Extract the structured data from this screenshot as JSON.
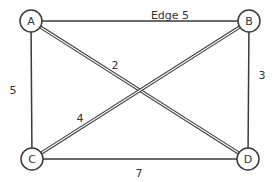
{
  "diagram": {
    "type": "weighted-undirected-graph",
    "colors": {
      "stroke": "#3a3a3a",
      "node_fill": "#ffffff",
      "text": "#333333",
      "background": "#ffffff"
    },
    "nodes": [
      {
        "id": "A",
        "label": "A",
        "x": 31,
        "y": 21,
        "r": 11
      },
      {
        "id": "B",
        "label": "B",
        "x": 249,
        "y": 21,
        "r": 11
      },
      {
        "id": "C",
        "label": "C",
        "x": 32,
        "y": 159,
        "r": 11
      },
      {
        "id": "D",
        "label": "D",
        "x": 248,
        "y": 159,
        "r": 11
      }
    ],
    "edges": [
      {
        "from": "A",
        "to": "B",
        "weight": "5",
        "label": "Edge 5",
        "style": "single",
        "label_x": 170,
        "label_y": 16
      },
      {
        "from": "A",
        "to": "C",
        "weight": "5",
        "label": "5",
        "style": "single",
        "label_x": 13,
        "label_y": 91
      },
      {
        "from": "B",
        "to": "D",
        "weight": "3",
        "label": "3",
        "style": "single",
        "label_x": 262,
        "label_y": 76
      },
      {
        "from": "C",
        "to": "D",
        "weight": "7",
        "label": "7",
        "style": "single",
        "label_x": 139,
        "label_y": 174
      },
      {
        "from": "A",
        "to": "D",
        "weight": "2",
        "label": "2",
        "style": "double",
        "label_x": 115,
        "label_y": 66
      },
      {
        "from": "B",
        "to": "C",
        "weight": "4",
        "label": "4",
        "style": "double",
        "label_x": 80,
        "label_y": 119
      }
    ]
  }
}
